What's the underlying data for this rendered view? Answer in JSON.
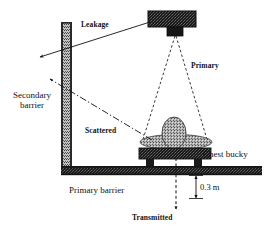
{
  "diagram": {
    "labels": {
      "leakage": "Leakage",
      "primary": "Primary",
      "secondary_barrier": "Secondary barrier",
      "secondary_barrier_line1": "Secondary",
      "secondary_barrier_line2": "barrier",
      "scattered": "Scattered",
      "chest_bucky": "Chest bucky",
      "primary_barrier": "Primary barrier",
      "distance": "0.3 m",
      "transmitted": "Transmitted"
    },
    "colors": {
      "ink": "#111111",
      "dark_fill": "#1c1c1c",
      "mid_fill": "#6e6e6e",
      "light_fill": "#b9b9b9",
      "background": "#ffffff"
    },
    "elements": {
      "xray_tube_head": "x-ray tube housing",
      "collimator": "collimator",
      "patient": "patient",
      "bucky": "chest bucky",
      "wall": "vertical secondary barrier wall",
      "floor": "horizontal primary barrier floor"
    },
    "radiation_paths": [
      {
        "name": "leakage",
        "style": "solid-arrow",
        "target": "secondary barrier"
      },
      {
        "name": "primary",
        "style": "dashed-cone",
        "target": "chest bucky"
      },
      {
        "name": "scattered",
        "style": "dash-dot-arrow",
        "target": "secondary barrier"
      },
      {
        "name": "transmitted",
        "style": "dashed-arrow",
        "target": "below primary barrier"
      }
    ],
    "dimensions": [
      {
        "name": "floor-clearance",
        "value": "0.3 m"
      }
    ]
  }
}
